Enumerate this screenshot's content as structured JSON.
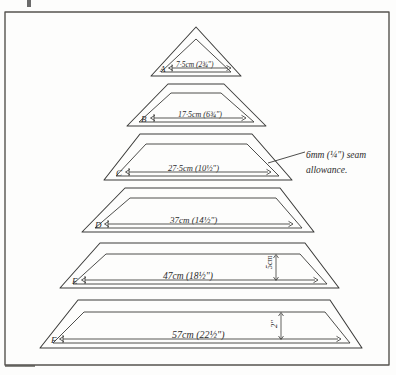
{
  "document": {
    "type": "hand-drawn sewing pattern diagram",
    "title_note": "Tiered skirt / cone tier panel sizes",
    "background_color": "#fdfdfc",
    "ink_color": "#3a3a38",
    "border": {
      "present": true,
      "color": "#4a4a48"
    }
  },
  "annotation": {
    "seam_allowance_line1": "6mm (¼\") seam",
    "seam_allowance_line2": "allowance.",
    "leader": "leader-line-to-tier-c"
  },
  "tiers": [
    {
      "id": "A",
      "label": "A",
      "shape": "triangle",
      "dimension_cm": "7·5cm",
      "dimension_in": "(2¾\")",
      "dimension_text": "7·5cm (2¾\")"
    },
    {
      "id": "B",
      "label": "B",
      "shape": "trapezoid",
      "dimension_cm": "17·5cm",
      "dimension_in": "(6¾\")",
      "dimension_text": "17·5cm (6¾\")"
    },
    {
      "id": "C",
      "label": "C",
      "shape": "trapezoid",
      "dimension_cm": "27·5cm",
      "dimension_in": "(10½\")",
      "dimension_text": "27·5cm (10½\")"
    },
    {
      "id": "D",
      "label": "D",
      "shape": "trapezoid",
      "dimension_cm": "37cm",
      "dimension_in": "(14½\")",
      "dimension_text": "37cm (14½\")"
    },
    {
      "id": "E",
      "label": "E",
      "shape": "trapezoid",
      "dimension_cm": "47cm",
      "dimension_in": "(18½\")",
      "dimension_text": "47cm (18½\")",
      "height_label": "5cm"
    },
    {
      "id": "F",
      "label": "F",
      "shape": "trapezoid",
      "dimension_cm": "57cm",
      "dimension_in": "(22½\")",
      "dimension_text": "57cm (22½\")",
      "height_label": "2\""
    }
  ]
}
